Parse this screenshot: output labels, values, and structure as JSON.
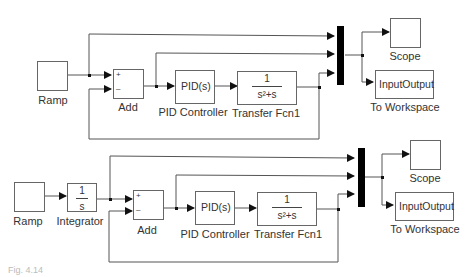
{
  "diagram": {
    "top": {
      "ramp_label": "Ramp",
      "add_label": "Add",
      "add_signs": [
        "+",
        "–"
      ],
      "pid_text": "PID(s)",
      "pid_label": "PID Controller",
      "tf_num": "1",
      "tf_den": "s²+s",
      "tf_label": "Transfer Fcn1",
      "scope_label": "Scope",
      "ws_text": "InputOutput",
      "ws_label": "To Workspace"
    },
    "bottom": {
      "ramp_label": "Ramp",
      "integrator_num": "1",
      "integrator_den": "s",
      "integrator_label": "Integrator",
      "add_label": "Add",
      "add_signs": [
        "+",
        "–"
      ],
      "pid_text": "PID(s)",
      "pid_label": "PID Controller",
      "tf_num": "1",
      "tf_den": "s²+s",
      "tf_label": "Transfer Fcn1",
      "scope_label": "Scope",
      "ws_text": "InputOutput",
      "ws_label": "To Workspace"
    },
    "caption": "Fig. 4.14"
  }
}
